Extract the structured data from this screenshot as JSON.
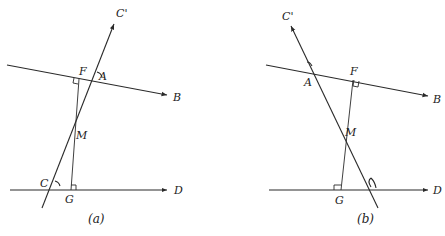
{
  "figure": {
    "panels": [
      {
        "id": "a",
        "caption": "(a)",
        "labels": {
          "c_prime": "C'",
          "f": "F",
          "a_angle": "A",
          "b": "B",
          "m": "M",
          "c": "C",
          "g": "G",
          "d": "D"
        }
      },
      {
        "id": "b",
        "caption": "(b)",
        "labels": {
          "c_prime": "C'",
          "a": "A",
          "f": "F",
          "b": "B",
          "m": "M",
          "g": "G",
          "d": "D"
        }
      }
    ],
    "colors": {
      "stroke": "#2a2a2a",
      "background": "#ffffff"
    }
  }
}
